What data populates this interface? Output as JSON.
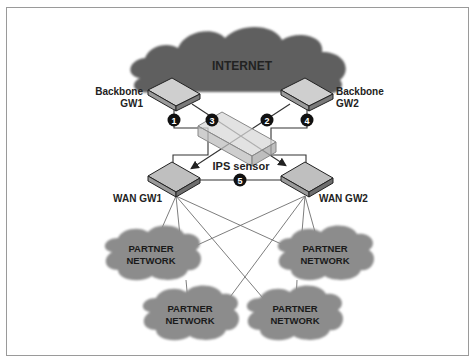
{
  "diagram": {
    "colors": {
      "internet_cloud": "#5f5f5f",
      "partner_cloud": "#8c8c8c",
      "router_top": "#cfcfcf",
      "router_side": "#9a9a9a",
      "ips_fill": "#d8d8d8",
      "line": "#333333",
      "thin_line": "#777777",
      "badge": "#111111",
      "border": "#9a9a9a"
    },
    "nodes": {
      "internet": {
        "label": "INTERNET"
      },
      "backbone_gw1": {
        "label_line1": "Backbone",
        "label_line2": "GW1"
      },
      "backbone_gw2": {
        "label_line1": "Backbone",
        "label_line2": "GW2"
      },
      "ips_sensor": {
        "label": "IPS sensor"
      },
      "wan_gw1": {
        "label": "WAN GW1"
      },
      "wan_gw2": {
        "label": "WAN GW2"
      },
      "partners": [
        {
          "line1": "PARTNER",
          "line2": "NETWORK"
        },
        {
          "line1": "PARTNER",
          "line2": "NETWORK"
        },
        {
          "line1": "PARTNER",
          "line2": "NETWORK"
        },
        {
          "line1": "PARTNER",
          "line2": "NETWORK"
        }
      ]
    },
    "badges": [
      "1",
      "2",
      "3",
      "4",
      "5"
    ]
  }
}
